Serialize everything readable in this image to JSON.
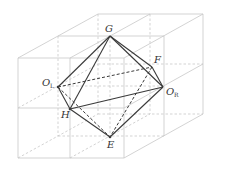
{
  "diagram": {
    "type": "octahedron-in-cube-grid",
    "colors": {
      "grid": "#c8c8c8",
      "edge": "#3a3a3a",
      "label": "#333333",
      "background": "#ffffff"
    },
    "vertices": [
      {
        "id": "G",
        "label": "G",
        "sub": ""
      },
      {
        "id": "F",
        "label": "F",
        "sub": ""
      },
      {
        "id": "OR",
        "label": "O",
        "sub": "R"
      },
      {
        "id": "OL",
        "label": "O",
        "sub": "L"
      },
      {
        "id": "H",
        "label": "H",
        "sub": ""
      },
      {
        "id": "E",
        "label": "E",
        "sub": ""
      }
    ],
    "solid_edges": [
      "G-OL",
      "G-H",
      "G-F",
      "G-OR",
      "F-OR",
      "OL-H",
      "H-OR",
      "H-E",
      "E-OR"
    ],
    "dashed_edges": [
      "OL-F",
      "OL-E",
      "F-E",
      "OL-OR"
    ]
  }
}
